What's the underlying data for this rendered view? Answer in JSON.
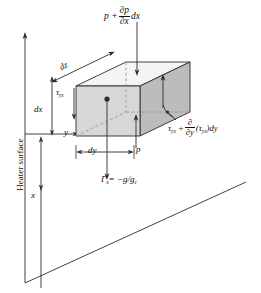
{
  "figure": {
    "type": "engineering-diagram",
    "labels": {
      "pressure_top": {
        "base": "p",
        "plus": "+",
        "numerator": "∂p",
        "denominator": "∂x",
        "trailing": "dx"
      },
      "tau_right": {
        "base": "τ",
        "base_sub": "yx",
        "plus": "+",
        "numerator": "∂",
        "denominator": "∂y",
        "trailing_open": "(",
        "trailing_tau": "τ",
        "trailing_tau_sub": "yx",
        "trailing_close": ")dy"
      },
      "gamma": {
        "symbol": "Γ",
        "symbol_sub": "x",
        "equals": "= −g/g",
        "equals_sub": "c"
      },
      "dz": "dz",
      "dx": "dx",
      "tau_left": {
        "base": "τ",
        "base_sub": "yx"
      },
      "y_axis": "y",
      "dy": "dy",
      "p_bottom": "p",
      "x_axis": "x",
      "heater_surface": "Heater surface"
    },
    "colors": {
      "stroke": "#2b2b2b",
      "front_face": "#d7d7d7",
      "right_face": "#bcbcbc",
      "top_face": "#f4f4f4",
      "background": "#ffffff",
      "dashed": "#8f8f8f"
    }
  }
}
